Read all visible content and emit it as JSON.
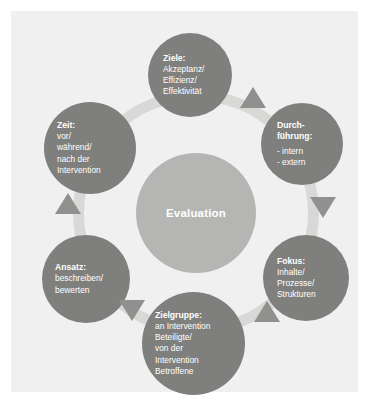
{
  "diagram": {
    "title": "Evaluation",
    "center": {
      "label": "Evaluation"
    },
    "colors": {
      "panel_background": "#eff0ef",
      "node_fill": "#7f807e",
      "center_fill": "#b5b6b4",
      "ring_fill": "#d8d9d7",
      "arrow_fill": "#8f918f",
      "text": "#ffffff"
    },
    "nodes": [
      {
        "id": "ziele",
        "position": "top",
        "title": "Ziele:",
        "body": "Akzeptanz/\nEffizienz/\nEffektivität"
      },
      {
        "id": "durchfuehrung",
        "position": "top-right",
        "title": "Durch-\nführung:",
        "body": "- intern\n- extern"
      },
      {
        "id": "fokus",
        "position": "bottom-right",
        "title": "Fokus:",
        "body": "Inhalte/\nProzesse/\nStrukturen"
      },
      {
        "id": "zielgruppe",
        "position": "bottom",
        "title": "Zielgruppe:",
        "body": "an Intervention\nBeteiligte/\nvon der\nIntervention\nBetroffene"
      },
      {
        "id": "ansatz",
        "position": "bottom-left",
        "title": "Ansatz:",
        "body": "beschreiben/\nbewerten"
      },
      {
        "id": "zeit",
        "position": "top-left",
        "title": "Zeit:",
        "body": "vor/\nwährend/\nnach der\nIntervention"
      }
    ],
    "arrows": [
      {
        "id": "arrow-ziele-durchfuehrung",
        "direction": "up"
      },
      {
        "id": "arrow-durchfuehrung-fokus",
        "direction": "down"
      },
      {
        "id": "arrow-fokus-zielgruppe",
        "direction": "up"
      },
      {
        "id": "arrow-zielgruppe-ansatz",
        "direction": "down"
      },
      {
        "id": "arrow-ansatz-zeit",
        "direction": "up"
      }
    ]
  }
}
